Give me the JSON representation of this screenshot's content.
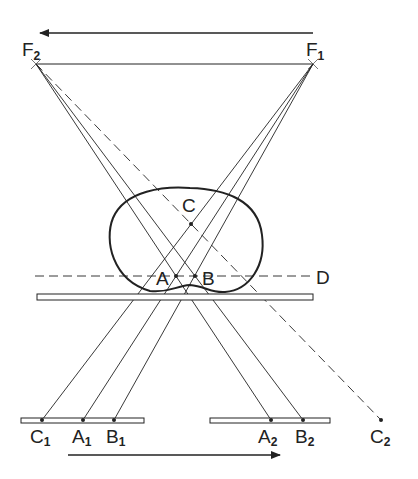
{
  "diagram": {
    "colors": {
      "stroke": "#222222",
      "background": "#ffffff"
    },
    "sources": {
      "F2": {
        "label": "F",
        "sub": "2"
      },
      "F1": {
        "label": "F",
        "sub": "1"
      }
    },
    "points": {
      "A": "A",
      "B": "B",
      "C": "C",
      "D": "D"
    },
    "detector_points": {
      "C1": {
        "label": "C",
        "sub": "1"
      },
      "A1": {
        "label": "A",
        "sub": "1"
      },
      "B1": {
        "label": "B",
        "sub": "1"
      },
      "A2": {
        "label": "A",
        "sub": "2"
      },
      "B2": {
        "label": "B",
        "sub": "2"
      },
      "C2": {
        "label": "C",
        "sub": "2"
      }
    },
    "arrows": {
      "top": "source-motion-left",
      "bottom": "detector-motion-right"
    }
  }
}
